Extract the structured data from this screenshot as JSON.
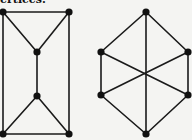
{
  "caption": "ertices.",
  "colors": {
    "background": "#f4f4f2",
    "ink": "#111111"
  },
  "graphs": [
    {
      "name": "left-graph",
      "vertices": [
        {
          "id": "a",
          "x": 3,
          "y": 12
        },
        {
          "id": "b",
          "x": 69,
          "y": 12
        },
        {
          "id": "c",
          "x": 37,
          "y": 52
        },
        {
          "id": "d",
          "x": 37,
          "y": 96
        },
        {
          "id": "e",
          "x": 3,
          "y": 134
        },
        {
          "id": "f",
          "x": 69,
          "y": 134
        }
      ],
      "edges": [
        [
          "a",
          "b"
        ],
        [
          "a",
          "c"
        ],
        [
          "b",
          "c"
        ],
        [
          "c",
          "d"
        ],
        [
          "d",
          "e"
        ],
        [
          "d",
          "f"
        ],
        [
          "e",
          "f"
        ],
        [
          "a",
          "e"
        ],
        [
          "b",
          "f"
        ]
      ]
    },
    {
      "name": "right-graph",
      "vertices": [
        {
          "id": "t",
          "x": 146,
          "y": 12
        },
        {
          "id": "ul",
          "x": 101,
          "y": 52
        },
        {
          "id": "ur",
          "x": 188,
          "y": 52
        },
        {
          "id": "ll",
          "x": 101,
          "y": 95
        },
        {
          "id": "lr",
          "x": 188,
          "y": 95
        },
        {
          "id": "bt",
          "x": 146,
          "y": 134
        }
      ],
      "edges": [
        [
          "t",
          "ul"
        ],
        [
          "t",
          "ur"
        ],
        [
          "t",
          "bt"
        ],
        [
          "ul",
          "ll"
        ],
        [
          "ur",
          "lr"
        ],
        [
          "ll",
          "bt"
        ],
        [
          "lr",
          "bt"
        ],
        [
          "ul",
          "lr"
        ],
        [
          "ur",
          "ll"
        ]
      ]
    }
  ]
}
